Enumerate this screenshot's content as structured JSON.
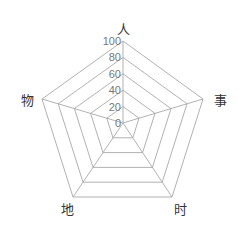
{
  "chart_data": {
    "type": "radar",
    "title": "",
    "indicators": [
      "人",
      "事",
      "时",
      "地",
      "物"
    ],
    "max": 100,
    "min": 0,
    "tick_labels": [
      "0",
      "20",
      "40",
      "60",
      "80",
      "100"
    ],
    "tick_values": [
      0,
      20,
      40,
      60,
      80,
      100
    ],
    "series": [],
    "grid": true,
    "legend": null,
    "colors": {
      "grid_line": "#a8a8a8",
      "tick_label": "#777777",
      "axis_name": "#333333",
      "background": "#ffffff"
    }
  }
}
